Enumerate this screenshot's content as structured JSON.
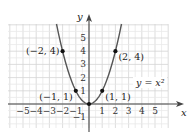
{
  "chart_data": {
    "type": "line",
    "title": "",
    "xlabel": "x",
    "ylabel": "y",
    "function": "y = x^2",
    "curve_label": "y = x²",
    "xlim": [
      -6,
      6
    ],
    "ylim": [
      -1.8,
      6
    ],
    "grid": true,
    "x_ticks": [
      -5,
      -4,
      -3,
      -2,
      -1,
      1,
      2,
      3,
      4,
      5
    ],
    "x_tick_labels": [
      "−5",
      "−4",
      "−3",
      "−2",
      "−1",
      "1",
      "2",
      "3",
      "4",
      "5"
    ],
    "y_ticks": [
      -1,
      1,
      2,
      3,
      4,
      5
    ],
    "y_tick_labels": [
      "−1",
      "1",
      "2",
      "3",
      "4",
      "5"
    ],
    "points": [
      {
        "x": -2,
        "y": 4,
        "label": "(−2, 4)"
      },
      {
        "x": -1,
        "y": 1,
        "label": "(−1, 1)"
      },
      {
        "x": 0,
        "y": 0,
        "label": ""
      },
      {
        "x": 1,
        "y": 1,
        "label": "(1, 1)"
      },
      {
        "x": 2,
        "y": 4,
        "label": "(2, 4)"
      }
    ],
    "series": [
      {
        "name": "y = x²",
        "x": [
          -2.5,
          -2,
          -1.5,
          -1,
          -0.5,
          0,
          0.5,
          1,
          1.5,
          2,
          2.5
        ],
        "values": [
          6.25,
          4,
          2.25,
          1,
          0.25,
          0,
          0.25,
          1,
          2.25,
          4,
          6.25
        ]
      }
    ],
    "colors": {
      "curve": "#555555",
      "axis": "#444444",
      "grid": "#d9d9d9",
      "point": "#111111"
    }
  }
}
